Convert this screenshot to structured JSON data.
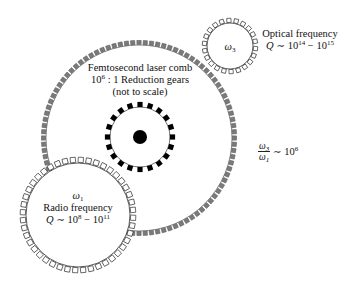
{
  "diagram": {
    "gears": [
      {
        "id": "comb",
        "label_lines": [
          "Femtosecond laser comb",
          "10^6 : 1 Reduction gears",
          "(not to scale)"
        ],
        "tooth_style": "filled-gray",
        "tooth_color": "#7a7a7a",
        "rim_color": "#555555"
      },
      {
        "id": "inner",
        "label_lines": [],
        "tooth_style": "filled-black",
        "tooth_color": "#000000",
        "hub_color": "#000000"
      },
      {
        "id": "radio",
        "symbol": "ω1",
        "name": "Radio frequency",
        "q_range": "Q ~ 10^8 − 10^11",
        "tooth_style": "hollow"
      },
      {
        "id": "optical",
        "symbol": "ω3",
        "name": "Optical frequency",
        "q_range": "Q ~ 10^14 − 10^15",
        "tooth_style": "hollow"
      }
    ],
    "ratio": {
      "numerator": "ω3",
      "denominator": "ω1",
      "relation": "~",
      "value_base": "10",
      "value_exp": "6"
    },
    "text": {
      "comb_line1": "Femtosecond laser comb",
      "comb_line2_base": "10",
      "comb_line2_exp": "6",
      "comb_line2_rest": " : 1 Reduction gears",
      "comb_line3": "(not to scale)",
      "optical_symbol_base": "ω",
      "optical_symbol_sub": "3",
      "optical_name": "Optical frequency",
      "optical_q_prefix": "Q",
      "optical_q_tilde": " ∼ 10",
      "optical_q_exp1": "14",
      "optical_q_mid": " − 10",
      "optical_q_exp2": "15",
      "radio_symbol_base": "ω",
      "radio_symbol_sub": "1",
      "radio_name": "Radio frequency",
      "radio_q_prefix": "Q",
      "radio_q_tilde": " ∼ 10",
      "radio_q_exp1": "8",
      "radio_q_mid": " − 10",
      "radio_q_exp2": "11",
      "ratio_num_base": "ω",
      "ratio_num_sub": "3",
      "ratio_den_base": "ω",
      "ratio_den_sub": "1",
      "ratio_tilde": " ∼ 10",
      "ratio_exp": "6"
    }
  }
}
